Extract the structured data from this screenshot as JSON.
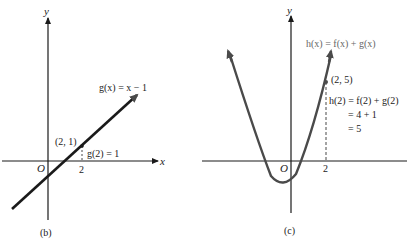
{
  "panels": [
    {
      "id": "b",
      "caption": "(b)",
      "axis_x": "x",
      "axis_y": "y",
      "origin": "O",
      "tick_label": "2",
      "function_label": "g(x) = x − 1",
      "point_label": "(2, 1)",
      "value_label": "g(2) = 1"
    },
    {
      "id": "c",
      "caption": "(c)",
      "axis_y": "y",
      "origin": "O",
      "tick_label": "2",
      "function_label": "h(x) = f(x) + g(x)",
      "point_label": "(2, 5)",
      "eval_lines": [
        "h(2) = f(2) + g(2)",
        "= 4 + 1",
        "= 5"
      ]
    }
  ],
  "colors": {
    "ink": "#1a1a1a",
    "curve": "#4a4a4a",
    "label_gray": "#777777"
  }
}
